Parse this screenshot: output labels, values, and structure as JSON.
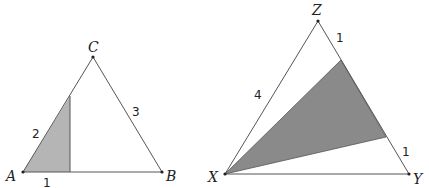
{
  "left_triangle": {
    "vertices": {
      "A": {
        "label": "A",
        "x": 23,
        "y": 172
      },
      "B": {
        "label": "B",
        "x": 162,
        "y": 172
      },
      "C": {
        "label": "C",
        "x": 93,
        "y": 57
      }
    },
    "side_labels": {
      "AC_part": "2",
      "CB": "3",
      "AB_part": "1"
    },
    "shaded_region": "small triangle at A cut by vertical line",
    "shade_color": "#b5b5b5"
  },
  "right_triangle": {
    "vertices": {
      "X": {
        "label": "X",
        "x": 225,
        "y": 174
      },
      "Y": {
        "label": "Y",
        "x": 409,
        "y": 174
      },
      "Z": {
        "label": "Z",
        "x": 318,
        "y": 21
      }
    },
    "side_labels": {
      "XZ": "4",
      "Z_top_segment": "1",
      "Y_bottom_segment": "1"
    },
    "shaded_region": "triangle from X to two points on ZY",
    "shade_color": "#8a8a8a"
  }
}
